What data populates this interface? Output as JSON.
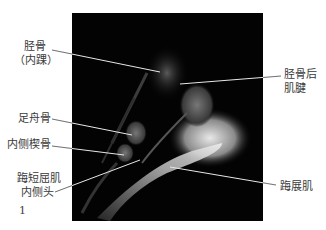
{
  "figure": {
    "number": "1",
    "image_description": "Sagittal MRI of the medial foot and ankle",
    "labels": {
      "tibia": {
        "line1": "胫骨",
        "line2": "（内踝）"
      },
      "tibialis_posterior": {
        "line1": "胫骨后",
        "line2": "肌腱"
      },
      "navicular": {
        "line1": "足舟骨"
      },
      "medial_cuneiform": {
        "line1": "内侧楔骨"
      },
      "fhb_medial_head": {
        "line1": "踇短屈肌",
        "line2": "内侧头"
      },
      "abductor_hallucis": {
        "line1": "踇展肌"
      }
    }
  },
  "colors": {
    "background": "#ffffff",
    "image_background": "#030303",
    "leader_line": "#e8e8e8",
    "text": "#3a3a3a"
  }
}
